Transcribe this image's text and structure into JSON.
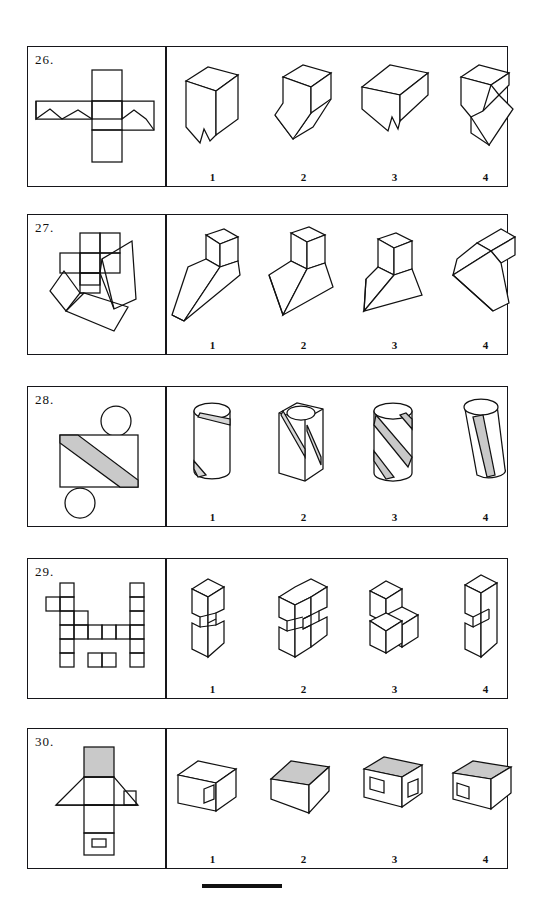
{
  "page": {
    "bottom_rule": true
  },
  "option_labels": [
    "1",
    "2",
    "3",
    "4"
  ],
  "questions": [
    {
      "number": "26.",
      "stem_description": "Flat net: cross of squares with two zig-zag folded side flaps",
      "options": [
        {
          "label": "1",
          "name": "cube-with-notch-front"
        },
        {
          "label": "2",
          "name": "block-with-slanted-step"
        },
        {
          "label": "3",
          "name": "flat-slab-with-notch"
        },
        {
          "label": "4",
          "name": "folded-zigzag-solid"
        }
      ]
    },
    {
      "number": "27.",
      "stem_description": "Flat net: small square cluster plus tilted quadrilateral panels",
      "options": [
        {
          "label": "1",
          "name": "wedge-with-cube-top-narrow"
        },
        {
          "label": "2",
          "name": "wedge-with-cube-top-wide"
        },
        {
          "label": "3",
          "name": "wedge-with-cube-top-upright"
        },
        {
          "label": "4",
          "name": "wedge-with-bar-top-tilted"
        }
      ]
    },
    {
      "number": "28.",
      "stem_description": "Flat net: rectangle with a shaded diagonal stripe and two circles",
      "options": [
        {
          "label": "1",
          "name": "cylinder-plain"
        },
        {
          "label": "2",
          "name": "prism-with-stripe"
        },
        {
          "label": "3",
          "name": "cylinder-with-wide-shaded-stripe"
        },
        {
          "label": "4",
          "name": "tilted-cylinder-with-stripe"
        }
      ]
    },
    {
      "number": "29.",
      "stem_description": "Flat net: irregular staircase arrangement of unit squares",
      "options": [
        {
          "label": "1",
          "name": "cube-stack-small"
        },
        {
          "label": "2",
          "name": "cube-stack-large"
        },
        {
          "label": "3",
          "name": "cube-stack-three"
        },
        {
          "label": "4",
          "name": "cube-stack-tall"
        }
      ]
    },
    {
      "number": "30.",
      "stem_description": "Flat net: house shape with shaded roof panel and two window openings",
      "options": [
        {
          "label": "1",
          "name": "box-plain-roof-one-window"
        },
        {
          "label": "2",
          "name": "box-shaded-roof-no-window"
        },
        {
          "label": "3",
          "name": "box-shaded-roof-two-windows"
        },
        {
          "label": "4",
          "name": "box-shaded-roof-one-window"
        }
      ]
    }
  ]
}
